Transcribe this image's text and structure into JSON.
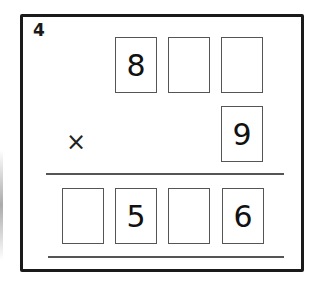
{
  "question": {
    "number": "4",
    "operator": "×",
    "multiplicand_digits": [
      "8",
      "",
      ""
    ],
    "multiplier_digits": [
      "9"
    ],
    "product_digits": [
      "",
      "5",
      "",
      "6"
    ]
  },
  "colors": {
    "frame": "#1a1a1a",
    "box_border": "#555555",
    "text": "#111111"
  }
}
